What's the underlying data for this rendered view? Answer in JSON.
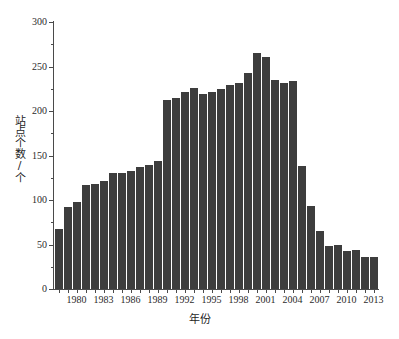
{
  "chart_data": {
    "type": "bar",
    "title": "",
    "xlabel": "年份",
    "ylabel": "站点个数/个",
    "ylim": [
      0,
      300
    ],
    "ytick_values": [
      0,
      50,
      100,
      150,
      200,
      250,
      300
    ],
    "ytick_labels": [
      "0",
      "50",
      "100",
      "150",
      "200",
      "250",
      "300"
    ],
    "yminor_step": 25,
    "grid": false,
    "legend": null,
    "bar_color": "#3d3d3d",
    "axis_color": "#4a4a4a",
    "background_color": "#ffffff",
    "xtick_labels": [
      "1980",
      "1983",
      "1986",
      "1989",
      "1992",
      "1995",
      "1998",
      "2001",
      "2004",
      "2007",
      "2010",
      "2013"
    ],
    "categories": [
      "1978",
      "1979",
      "1980",
      "1981",
      "1982",
      "1983",
      "1984",
      "1985",
      "1986",
      "1987",
      "1988",
      "1989",
      "1990",
      "1991",
      "1992",
      "1993",
      "1994",
      "1995",
      "1996",
      "1997",
      "1998",
      "1999",
      "2000",
      "2001",
      "2002",
      "2003",
      "2004",
      "2005",
      "2006",
      "2007",
      "2008",
      "2009",
      "2010",
      "2011",
      "2012",
      "2013"
    ],
    "values": [
      67,
      92,
      98,
      117,
      118,
      121,
      130,
      130,
      133,
      137,
      139,
      144,
      212,
      215,
      221,
      226,
      219,
      221,
      225,
      229,
      231,
      243,
      265,
      261,
      235,
      232,
      234,
      138,
      93,
      65,
      48,
      49,
      43,
      44,
      36,
      36
    ],
    "series": [
      {
        "name": "站点个数",
        "values": [
          67,
          92,
          98,
          117,
          118,
          121,
          130,
          130,
          133,
          137,
          139,
          144,
          212,
          215,
          221,
          226,
          219,
          221,
          225,
          229,
          231,
          243,
          265,
          261,
          235,
          232,
          234,
          138,
          93,
          65,
          48,
          49,
          43,
          44,
          36,
          36
        ]
      }
    ]
  },
  "figure": {
    "caption_fragment": ""
  }
}
